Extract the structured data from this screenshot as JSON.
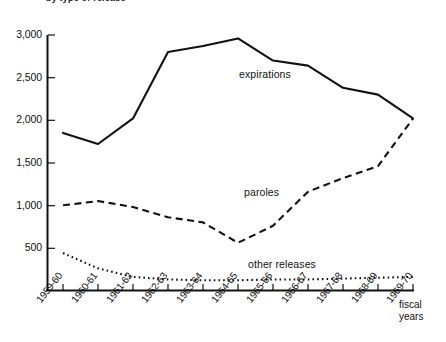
{
  "chart_data": {
    "type": "line",
    "title": "by type of release",
    "xlabel": "fiscal years",
    "ylabel": "",
    "grid": false,
    "legend_position": "inline-annotations",
    "x": [
      "1959-60",
      "1960-61",
      "1961-62",
      "1962-63",
      "1963-64",
      "1964-65",
      "1965-66",
      "1966-67",
      "1967-68",
      "1968-69",
      "1969-70"
    ],
    "ylim": [
      0,
      3000
    ],
    "yticks": [
      500,
      1000,
      1500,
      2000,
      2500,
      3000
    ],
    "ytick_labels": [
      "500",
      "1,000",
      "1,500",
      "2,000",
      "2,500",
      "3,000"
    ],
    "series": [
      {
        "name": "expirations",
        "style": "solid",
        "values": [
          1850,
          1720,
          2020,
          2800,
          2870,
          2960,
          2700,
          2640,
          2380,
          2300,
          2020
        ]
      },
      {
        "name": "paroles",
        "style": "dashed",
        "values": [
          1000,
          1050,
          980,
          860,
          800,
          560,
          760,
          1160,
          1320,
          1460,
          2020
        ]
      },
      {
        "name": "other releases",
        "style": "dotted",
        "values": [
          440,
          260,
          160,
          130,
          120,
          120,
          130,
          130,
          140,
          150,
          160
        ]
      }
    ]
  },
  "axis": {
    "caption_line1": "fiscal",
    "caption_line2": "years"
  }
}
